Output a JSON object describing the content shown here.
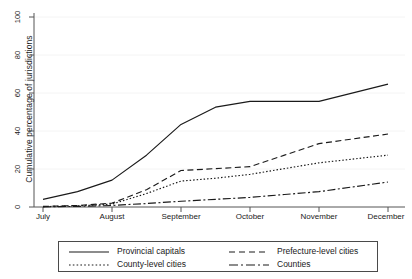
{
  "chart_data": {
    "type": "line",
    "title": "",
    "xlabel": "",
    "ylabel": "Cumulative percentage of jurisdictions",
    "x": [
      "July",
      "August",
      "September",
      "October",
      "November",
      "December"
    ],
    "xtick_labels": [
      "July",
      "August",
      "September",
      "October",
      "November",
      "December"
    ],
    "ytick_labels": [
      "0",
      "20",
      "40",
      "60",
      "80",
      "100"
    ],
    "ytick_values": [
      0,
      20,
      40,
      60,
      80,
      100
    ],
    "ylim": [
      0,
      100
    ],
    "grid": "horizontal",
    "legend_position": "below-axes",
    "series": [
      {
        "name": "Provincial capitals",
        "style": "solid",
        "values": [
          4,
          14,
          43,
          55,
          55,
          64
        ],
        "points": [
          {
            "x": "July",
            "y": 4
          },
          {
            "x": "July-mid",
            "y": 8
          },
          {
            "x": "August",
            "y": 14
          },
          {
            "x": "August-mid",
            "y": 27
          },
          {
            "x": "September",
            "y": 43
          },
          {
            "x": "September-mid",
            "y": 52
          },
          {
            "x": "October",
            "y": 55
          },
          {
            "x": "November",
            "y": 55
          },
          {
            "x": "December",
            "y": 64
          }
        ]
      },
      {
        "name": "Prefecture-level cities",
        "style": "dashed",
        "values": [
          0.3,
          2,
          19,
          21,
          33,
          38
        ],
        "points": [
          {
            "x": "July",
            "y": 0.3
          },
          {
            "x": "July-mid",
            "y": 0.8
          },
          {
            "x": "August",
            "y": 2
          },
          {
            "x": "August-mid",
            "y": 9
          },
          {
            "x": "September",
            "y": 19
          },
          {
            "x": "September-mid",
            "y": 20
          },
          {
            "x": "October",
            "y": 21
          },
          {
            "x": "October-mid",
            "y": 27
          },
          {
            "x": "November",
            "y": 33
          },
          {
            "x": "December",
            "y": 38
          }
        ]
      },
      {
        "name": "County-level cities",
        "style": "dotted",
        "values": [
          0.2,
          1.5,
          13.5,
          17,
          23,
          27
        ],
        "points": [
          {
            "x": "July",
            "y": 0.2
          },
          {
            "x": "July-mid",
            "y": 0.6
          },
          {
            "x": "August",
            "y": 1.5
          },
          {
            "x": "August-mid",
            "y": 7
          },
          {
            "x": "September",
            "y": 13.5
          },
          {
            "x": "September-mid",
            "y": 15
          },
          {
            "x": "October",
            "y": 17
          },
          {
            "x": "October-mid",
            "y": 20
          },
          {
            "x": "November",
            "y": 23
          },
          {
            "x": "December",
            "y": 27
          }
        ]
      },
      {
        "name": "Counties",
        "style": "dash-dot",
        "values": [
          0.1,
          0.8,
          3,
          5,
          8,
          13
        ],
        "points": [
          {
            "x": "July",
            "y": 0.1
          },
          {
            "x": "July-mid",
            "y": 0.3
          },
          {
            "x": "August",
            "y": 0.8
          },
          {
            "x": "August-mid",
            "y": 1.8
          },
          {
            "x": "September",
            "y": 3
          },
          {
            "x": "September-mid",
            "y": 4
          },
          {
            "x": "October",
            "y": 5
          },
          {
            "x": "October-mid",
            "y": 6.5
          },
          {
            "x": "November",
            "y": 8
          },
          {
            "x": "December",
            "y": 13
          }
        ]
      }
    ]
  },
  "legend": {
    "entries": [
      {
        "label": "Provincial capitals",
        "style": "solid"
      },
      {
        "label": "Prefecture-level cities",
        "style": "dashed"
      },
      {
        "label": "County-level cities",
        "style": "dotted"
      },
      {
        "label": "Counties",
        "style": "dash-dot"
      }
    ]
  },
  "colors": {
    "line": "#1a1a1a",
    "axis": "#555555",
    "grid": "#f2f2f2",
    "background": "#ffffff"
  }
}
